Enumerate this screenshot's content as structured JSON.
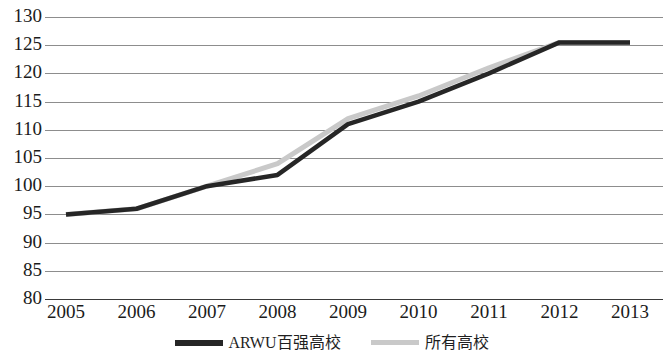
{
  "chart_data": {
    "type": "line",
    "title": "",
    "subtitle": "",
    "xlabel": "",
    "ylabel": "",
    "x": [
      "2005",
      "2006",
      "2007",
      "2008",
      "2009",
      "2010",
      "2011",
      "2012",
      "2013"
    ],
    "categories": [
      "2005",
      "2006",
      "2007",
      "2008",
      "2009",
      "2010",
      "2011",
      "2012",
      "2013"
    ],
    "series": [
      {
        "name": "ARWU百强高校",
        "color": "#262626",
        "values": [
          95,
          96,
          100,
          102,
          111,
          115,
          120,
          125.5,
          125.5
        ]
      },
      {
        "name": "所有高校",
        "color": "#c9c9c9",
        "values": [
          95,
          96,
          100,
          104,
          112,
          116,
          121,
          125.5,
          125.5
        ]
      }
    ],
    "ylim": [
      80,
      130
    ],
    "xlim": [
      "2005",
      "2013"
    ],
    "yticks": [
      "130",
      "125",
      "120",
      "115",
      "110",
      "105",
      "100",
      "95",
      "90",
      "85",
      "80"
    ],
    "ytick_values": [
      130,
      125,
      120,
      115,
      110,
      105,
      100,
      95,
      90,
      85,
      80
    ],
    "ystep": 5,
    "grid": "horizontal",
    "grid_color": "#8d8d8d",
    "axis_color": "#3a3a3a",
    "legend_position": "bottom-center",
    "legend": [
      {
        "label": "ARWU百强高校",
        "color": "#262626",
        "style": "dark-line"
      },
      {
        "label": "所有高校",
        "color": "#c9c9c9",
        "style": "light-line"
      }
    ],
    "annotations": []
  }
}
